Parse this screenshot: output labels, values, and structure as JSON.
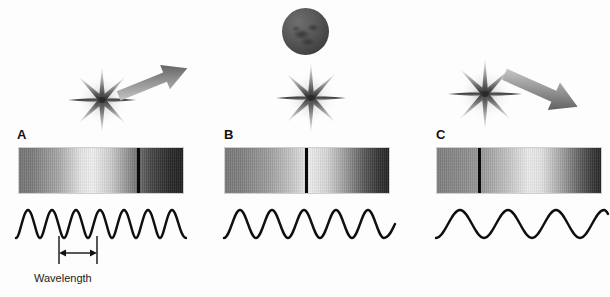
{
  "figure": {
    "background_color": "#ffffff",
    "width": 608,
    "height": 297
  },
  "panels": [
    {
      "id": "A",
      "letter": "A",
      "motion": "approaching",
      "motion_label": "moving toward observer",
      "arrow_direction": "up-right",
      "star_label": "star",
      "spectrum": {
        "label": "blueshifted-spectrum",
        "x": 18,
        "y": 147,
        "width": 166,
        "height": 47,
        "line_position_pct": 72,
        "line_color": "#0a0a0a",
        "gradient_stops": [
          "#767676",
          "#7d7d7d",
          "#a9a9a9",
          "#e8e8e8",
          "#f2f2f2",
          "#cfcfcf",
          "#8a8a8a",
          "#4a4a4a",
          "#2b2b2b",
          "#222222"
        ]
      },
      "wave": {
        "label": "short-wavelength-wave",
        "cycles": 4,
        "x": 14,
        "y": 200,
        "width": 174,
        "height": 46,
        "amplitude": 16
      },
      "measure": {
        "label": "Wavelength",
        "visible": true,
        "x_start": 58,
        "x_end": 96,
        "y": 257
      }
    },
    {
      "id": "B",
      "letter": "B",
      "motion": "stationary",
      "motion_label": "at rest relative to observer",
      "arrow_direction": "none",
      "star_label": "star",
      "planet": {
        "label": "observer-planet",
        "x": 282,
        "y": 8,
        "size": 47
      },
      "spectrum": {
        "label": "rest-spectrum",
        "x": 224,
        "y": 147,
        "width": 166,
        "height": 47,
        "line_position_pct": 49,
        "line_color": "#0a0a0a",
        "gradient_stops": [
          "#7a7a7a",
          "#828282",
          "#9e9e9e",
          "#c6c6c6",
          "#efefef",
          "#d8d8d8",
          "#9a9a9a",
          "#5a5a5a",
          "#343434",
          "#262626"
        ]
      },
      "wave": {
        "label": "medium-wavelength-wave",
        "cycles": 3,
        "x": 222,
        "y": 200,
        "width": 174,
        "height": 46,
        "amplitude": 16
      },
      "measure": {
        "label": "",
        "visible": false
      }
    },
    {
      "id": "C",
      "letter": "C",
      "motion": "receding",
      "motion_label": "moving away from observer",
      "arrow_direction": "down-right",
      "star_label": "star",
      "spectrum": {
        "label": "redshifted-spectrum",
        "x": 436,
        "y": 147,
        "width": 166,
        "height": 47,
        "line_position_pct": 25,
        "line_color": "#0a0a0a",
        "gradient_stops": [
          "#808080",
          "#8a8a8a",
          "#9c9c9c",
          "#c8c8c8",
          "#eeeeee",
          "#e4e4e4",
          "#a4a4a4",
          "#626262",
          "#3a3a3a",
          "#282828"
        ]
      },
      "wave": {
        "label": "long-wavelength-wave",
        "cycles": 2.5,
        "x": 434,
        "y": 200,
        "width": 174,
        "height": 46,
        "amplitude": 16
      },
      "measure": {
        "label": "",
        "visible": false
      }
    }
  ],
  "colors": {
    "ink": "#111111",
    "line": "#0a0a0a",
    "arrow_light": "#c9c9c9",
    "arrow_dark": "#4f4f4f",
    "star_dark": "#3a3a3a",
    "planet_dark": "#3e3e3e"
  }
}
